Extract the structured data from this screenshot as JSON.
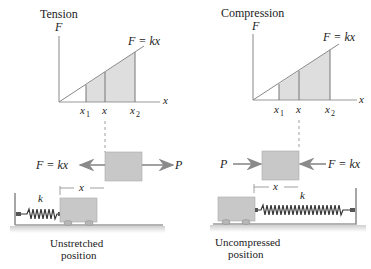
{
  "left_panel": {
    "title": "Tension",
    "y_axis": "F",
    "x_axis": "x",
    "line_label": "F = kx",
    "ticks": [
      "x",
      "x",
      "x"
    ],
    "tick_subs": [
      "1",
      "",
      "2"
    ],
    "force_left": "F = kx",
    "force_right": "P",
    "disp_label": "x",
    "spring_label": "k",
    "caption_line1": "Unstretched",
    "caption_line2": "position"
  },
  "right_panel": {
    "title": "Compression",
    "y_axis": "F",
    "x_axis": "x",
    "line_label": "F = kx",
    "ticks": [
      "x",
      "x",
      "x"
    ],
    "tick_subs": [
      "1",
      "",
      "2"
    ],
    "force_left": "P",
    "force_right": "F = kx",
    "disp_label": "x",
    "spring_label": "k",
    "caption_line1": "Uncompressed",
    "caption_line2": "position"
  },
  "colors": {
    "shade": "#dedede",
    "block": "#c8c8c8",
    "arrow": "#8a8a8a",
    "axis": "#777777",
    "ground": "#9a9a9a"
  }
}
